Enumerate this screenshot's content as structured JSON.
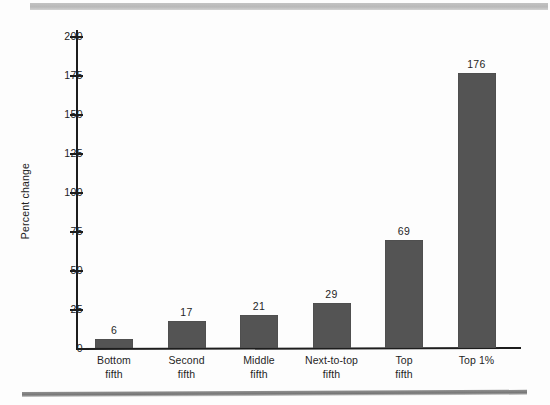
{
  "chart_data": {
    "type": "bar",
    "title": "",
    "xlabel": "",
    "ylabel": "Percent change",
    "ylim": [
      0,
      200
    ],
    "yticks": [
      0,
      25,
      50,
      75,
      100,
      125,
      150,
      175,
      200
    ],
    "ytick_labels": [
      "0",
      "25",
      "50",
      "75",
      "100",
      "125",
      "150",
      "175",
      "200"
    ],
    "grid": false,
    "legend": null,
    "bar_color": "#545454",
    "categories": [
      "Bottom fifth",
      "Second fifth",
      "Middle fifth",
      "Next-to-top fifth",
      "Top fifth",
      "Top 1%"
    ],
    "category_lines": [
      [
        "Bottom",
        "fifth"
      ],
      [
        "Second",
        "fifth"
      ],
      [
        "Middle",
        "fifth"
      ],
      [
        "Next-to-top",
        "fifth"
      ],
      [
        "Top",
        "fifth"
      ],
      [
        "Top 1%",
        ""
      ]
    ],
    "values": [
      6,
      17,
      21,
      29,
      69,
      176
    ],
    "value_labels": [
      "6",
      "17",
      "21",
      "29",
      "69",
      "176"
    ]
  }
}
